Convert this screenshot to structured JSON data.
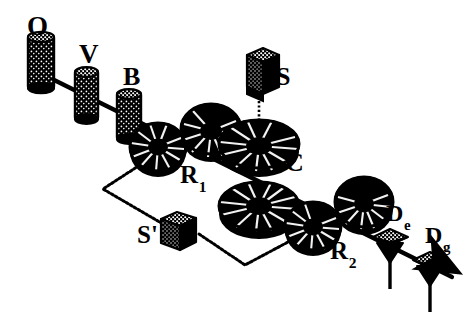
{
  "figure": {
    "background_color": "#ffffff",
    "ink_color": "#000000",
    "width": 474,
    "height": 321
  },
  "labels": {
    "oven": "O",
    "velocity_selector": "V",
    "box": "B",
    "source_s": "S",
    "cavity": "C",
    "ramsey_one_main": "R",
    "ramsey_one_sub": "1",
    "source_s_prime": "S'",
    "ramsey_two_main": "R",
    "ramsey_two_sub": "2",
    "detector_e_main": "D",
    "detector_e_sub": "e",
    "detector_g_main": "D",
    "detector_g_sub": "g"
  },
  "components": [
    {
      "id": "O",
      "kind": "cylinder",
      "label": "O",
      "cx": 40,
      "cy": 73,
      "note": "oven"
    },
    {
      "id": "V",
      "kind": "cylinder",
      "label": "V",
      "cx": 86,
      "cy": 96,
      "note": "velocity selector"
    },
    {
      "id": "B",
      "kind": "cylinder",
      "label": "B",
      "cx": 129,
      "cy": 117,
      "note": "box"
    },
    {
      "id": "R1",
      "kind": "ring",
      "label": "R1",
      "cx": 158,
      "cy": 150,
      "note": "first Ramsey zone"
    },
    {
      "id": "X1",
      "kind": "ring",
      "label": "",
      "cx": 210,
      "cy": 130,
      "note": "unlabelled ring before cavity"
    },
    {
      "id": "C",
      "kind": "ring",
      "label": "C",
      "cx": 259,
      "cy": 147,
      "note": "microwave cavity"
    },
    {
      "id": "S",
      "kind": "cube",
      "label": "S",
      "cx": 259,
      "cy": 78,
      "note": "microwave source S above cavity"
    },
    {
      "id": "X2",
      "kind": "ring",
      "label": "",
      "cx": 259,
      "cy": 207,
      "note": "unlabelled ring below cavity"
    },
    {
      "id": "R2",
      "kind": "ring",
      "label": "R2",
      "cx": 312,
      "cy": 227,
      "note": "second Ramsey zone"
    },
    {
      "id": "X3",
      "kind": "ring",
      "label": "",
      "cx": 364,
      "cy": 203,
      "note": "unlabelled ring before detectors"
    },
    {
      "id": "De",
      "kind": "detector",
      "label": "De",
      "cx": 390,
      "cy": 239,
      "note": "detector for state e"
    },
    {
      "id": "Dg",
      "kind": "detector",
      "label": "Dg",
      "cx": 430,
      "cy": 262,
      "note": "detector for state g"
    },
    {
      "id": "Sp",
      "kind": "cube",
      "label": "S'",
      "cx": 175,
      "cy": 229,
      "note": "microwave source S-prime feeding Ramsey zones"
    }
  ],
  "connections": [
    {
      "from": "O",
      "to": "Dg",
      "style": "solid",
      "note": "atomic beam axis"
    },
    {
      "from": "S",
      "to": "C",
      "style": "dotted",
      "note": "vertical feed into cavity"
    },
    {
      "from": "R1",
      "to": "Sp",
      "style": "dotted",
      "note": "feed line R1 to S'"
    },
    {
      "from": "Sp",
      "to": "R2",
      "style": "dotted",
      "note": "feed line S' to R2"
    }
  ],
  "arrow": {
    "present": true,
    "direction": "down-right",
    "note": "beam exit arrow past Dg"
  }
}
